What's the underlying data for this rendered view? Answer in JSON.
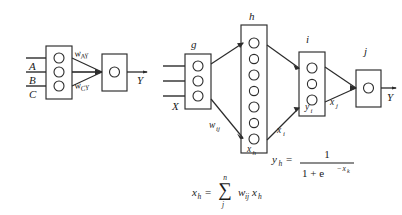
{
  "figure": {
    "background_color": "#ffffff",
    "ink_color": "#2b2b2b"
  },
  "left_diagram": {
    "name": "simple-perceptron",
    "input_labels": [
      "A",
      "B",
      "C"
    ],
    "input_layer": {
      "label": "",
      "node_count": 3
    },
    "output_layer": {
      "label": "",
      "node_count": 1
    },
    "weight_labels": [
      "w",
      "AY",
      "w",
      "CY"
    ],
    "weight_label_1_base": "w",
    "weight_label_1_sub": "AY",
    "weight_label_2_base": "w",
    "weight_label_2_sub": "CY",
    "output_label": "Y"
  },
  "right_diagram": {
    "name": "multilayer-network",
    "layers": [
      {
        "key": "g",
        "label": "g",
        "node_count": 3,
        "side_label": "X",
        "bottom_label": ""
      },
      {
        "key": "h",
        "label": "h",
        "node_count": 7,
        "side_label": "",
        "bottom_label_base": "x",
        "bottom_label_sub": "h"
      },
      {
        "key": "i",
        "label": "i",
        "node_count": 3,
        "side_label": "",
        "inner_label_base": "y",
        "inner_label_sub": "i"
      },
      {
        "key": "j",
        "label": "j",
        "node_count": 1,
        "side_label": "",
        "bottom_label": ""
      }
    ],
    "edge_labels": [
      {
        "base": "w",
        "sub": "ij"
      },
      {
        "base": "x",
        "sub": "i"
      },
      {
        "base": "x",
        "sub": "j"
      }
    ],
    "output_label": "Y"
  },
  "equations": {
    "sigmoid": {
      "lhs_base": "y",
      "lhs_sub": "h",
      "equals": "=",
      "numerator": "1",
      "denominator_one": "1 + e",
      "denominator_exp_minus": "−",
      "denominator_exp_base": "x",
      "denominator_exp_sub": "k",
      "plain": "y_h = 1 / (1 + e^(-x_k))"
    },
    "weighted_sum": {
      "lhs_base": "x",
      "lhs_sub": "h",
      "equals": "=",
      "sigma": "∑",
      "sigma_top": "n",
      "sigma_bottom": "j",
      "term_w": "w",
      "term_w_sub": "ij",
      "term_x": "x",
      "term_x_sub": "h",
      "plain": "x_h = sum_{j}^{n} w_ij x_h"
    }
  }
}
